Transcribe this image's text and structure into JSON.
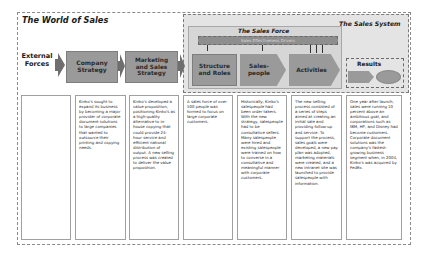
{
  "diagram": {
    "title": "The World of Sales",
    "sales_system": {
      "title": "The Sales System",
      "sales_force": {
        "title": "The Sales Force",
        "drivers_label": "Sales Effectiveness Drivers",
        "stages": [
          {
            "label": "Structure and Roles"
          },
          {
            "label": "Sales-people"
          },
          {
            "label": "Activities"
          }
        ]
      },
      "results": {
        "title": "Results"
      }
    },
    "flow": [
      {
        "label": "External Forces"
      },
      {
        "label": "Company Strategy"
      },
      {
        "label": "Marketing and Sales Strategy"
      }
    ],
    "colors": {
      "box_fill": "#9a9a9a",
      "system_fill": "#e4e4e4",
      "force_fill": "#d6d6d6",
      "drivers_fill": "#8e8e8e",
      "arrow": "#6e6e6e"
    },
    "columns": [
      {
        "text": ""
      },
      {
        "text": "Kinko's sought to expand its business by becoming a major provider of corporate document solutions to large companies that wanted to outsource their printing and copying needs."
      },
      {
        "text": "Kinko's developed a value proposition, positioning Kinko's as a high-quality alternative to in-house copying that could provide 24-hour service and efficient national distribution of output. A new selling process was created to deliver the value proposition."
      },
      {
        "text": "A sales force of over 500 people was formed to focus on large corporate customers."
      },
      {
        "text": "Historically, Kinko's salespeople had been order takers. With the new strategy, salespeople had to be consultative sellers. Many salespeople were hired and existing salespeople were trained on how to converse in a consultative and meaningful manner with corporate customers."
      },
      {
        "text": "The new selling process consisted of a series of steps aimed at creating an initial sale and providing follow-up and service. To support the process, sales goals were developed, a new pay plan was adopted, marketing materials were created, and a new intranet site was launched to provide salespeople with information."
      },
      {
        "text": "One year after launch, sales were running 10 percent above an ambitious goal, and corporations such as IBM, HP, and Disney had become customers. Corporate document solutions was the company's fastest-growing business segment when, in 2004, Kinko's was acquired by FedEx."
      }
    ]
  }
}
